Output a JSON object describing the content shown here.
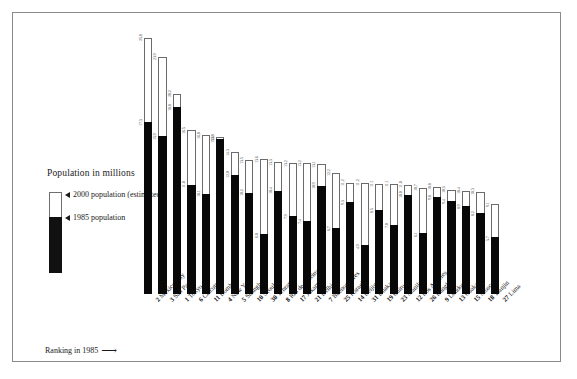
{
  "legend": {
    "title": "Population in millions",
    "series_2000_label": "2000 population (estimated)",
    "series_1985_label": "1985 population",
    "swatch_2000_color": "#ffffff",
    "swatch_1985_color": "#111111"
  },
  "footer": {
    "ranking_note": "Ranking in 1985",
    "ranking_arrow": "⟶"
  },
  "chart_data": {
    "type": "bar",
    "title": "Population in millions",
    "xlabel": "",
    "ylabel": "Population in millions",
    "ylim": [
      0,
      26
    ],
    "grid": false,
    "legend_position": "left",
    "note": "Ranking in 1985",
    "categories": [
      "Mexico City",
      "São Paulo",
      "Tokyo",
      "Calcutta",
      "Bombay",
      "New York",
      "Shanghai",
      "Seoul",
      "Tehran",
      "Rio de Janeiro",
      "Jakarta",
      "Delhi",
      "Buenos Aires",
      "Karachi",
      "Beijing",
      "Dhaka",
      "Cairo",
      "Manila",
      "Los Angeles",
      "Bangkok",
      "London",
      "Osaka",
      "Moscow",
      "Tianjin",
      "Lima"
    ],
    "ranks_1985": [
      2,
      3,
      1,
      6,
      11,
      4,
      5,
      10,
      30,
      8,
      17,
      21,
      7,
      25,
      14,
      31,
      19,
      23,
      12,
      26,
      9,
      13,
      15,
      18,
      27
    ],
    "series": [
      {
        "name": "1985 population",
        "color": "#080808",
        "values": [
          17.3,
          15.9,
          18.8,
          11.0,
          10.1,
          15.6,
          12.0,
          10.2,
          6.0,
          10.4,
          7.9,
          7.4,
          10.9,
          6.7,
          9.3,
          4.9,
          8.5,
          7.0,
          10.0,
          6.1,
          9.8,
          9.4,
          8.9,
          8.2,
          5.7
        ]
      },
      {
        "name": "2000 population (estimated)",
        "color": "#ffffff",
        "values": [
          25.8,
          23.9,
          20.2,
          16.5,
          16.0,
          15.8,
          14.3,
          13.5,
          13.6,
          13.3,
          13.2,
          13.2,
          13.1,
          12.2,
          11.2,
          11.2,
          11.1,
          11.1,
          11.0,
          10.7,
          10.8,
          10.5,
          10.4,
          10.3,
          9.1
        ]
      }
    ],
    "labels_2000": [
      "25.8",
      "23.9",
      "20.2",
      "16.5",
      "16.0",
      "15.8",
      "14.3",
      "13.5",
      "13.6",
      "13.3",
      "13.2",
      "13.2",
      "13.1",
      "12.2",
      "11.2",
      "11.2",
      "11.1",
      "11.1",
      "11.0",
      "10.7",
      "10.8",
      "10.5",
      "10.4",
      "10.3",
      "9.1"
    ],
    "labels_1985": [
      "17.3",
      "15.9",
      "18.8",
      "11.0",
      "10.1",
      "15.6",
      "12.0",
      "10.2",
      "6.0",
      "10.4",
      "7.9",
      "7.4",
      "10.9",
      "6.7",
      "9.3",
      "4.9",
      "8.5",
      "7.0",
      "10.0",
      "6.1",
      "9.8",
      "9.4",
      "8.9",
      "8.2",
      "5.7"
    ]
  }
}
